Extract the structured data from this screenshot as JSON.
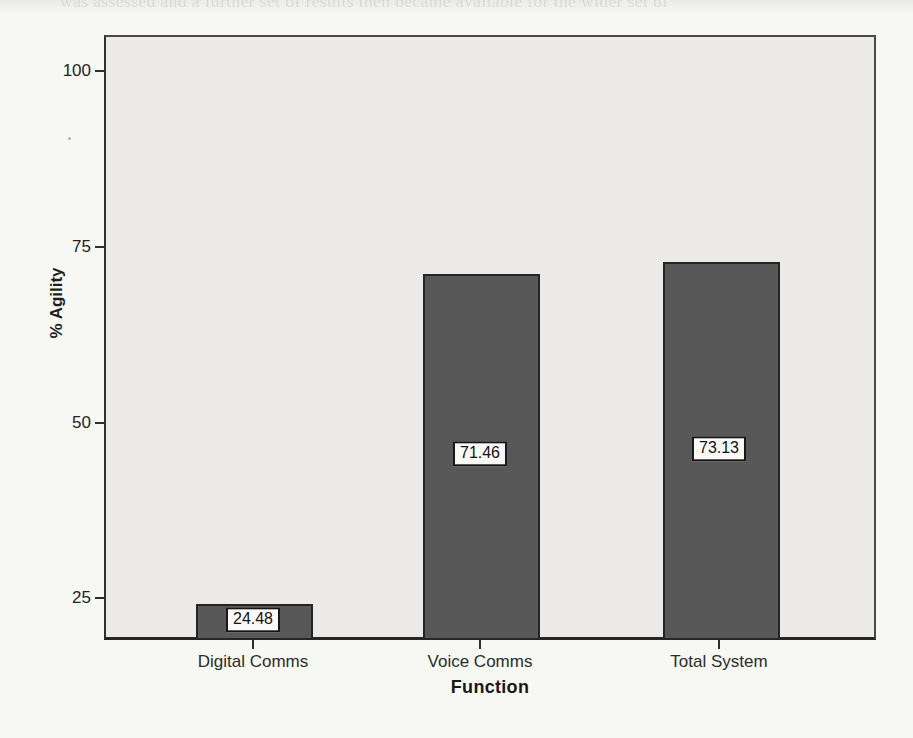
{
  "page": {
    "kind": "scanned book page with statistics figure",
    "background_color": "#f7f7f4"
  },
  "chart_data": {
    "type": "bar",
    "title": "",
    "xlabel": "Function",
    "ylabel": "% Agility",
    "categories": [
      "Digital Comms",
      "Voice Comms",
      "Total System"
    ],
    "values": [
      24.48,
      71.46,
      73.13
    ],
    "value_labels": [
      "24.48",
      "71.46",
      "73.13"
    ],
    "y_ticks": [
      100,
      75,
      50,
      25
    ],
    "ylim": [
      19.5,
      104.9
    ],
    "grid": false,
    "legend": false,
    "bar_color": "#585859",
    "bar_border_color": "#242424",
    "plot_background": "#ebeae7",
    "value_label_style": "white box with black border centered inside each bar"
  },
  "bleedthrough": {
    "note": "faint, mostly illegible show-through text from the reverse side of the page",
    "lines": [
      {
        "x": 60,
        "y": -9,
        "text": "was assessed and a further set of results then became available for the wider set of"
      },
      {
        "x": 185,
        "y": 44,
        "text": "that the overall results are more consistent than they might at first appear"
      },
      {
        "x": 150,
        "y": 74,
        "text": "sistent with Alberts and Hayes' (2003) interpretation of what the"
      },
      {
        "x": 142,
        "y": 104,
        "text": "when mapped to the NATO SAS-050 approach space. In this case the b"
      },
      {
        "x": 138,
        "y": 134,
        "text": "behaved 'voice' messaging within the MIP, different media were"
      },
      {
        "x": 132,
        "y": 163,
        "text": "faster agility, but the more complex and prescribed compass-bas"
      },
      {
        "x": 172,
        "y": 193,
        "text": "such as decentralised faster report"
      },
      {
        "x": 196,
        "y": 228,
        "text": "This chapter has not put forward any specific a priori hypotheses"
      },
      {
        "x": 146,
        "y": 260,
        "text": "been given voice but in the analysis of C2, and even then it seemed"
      },
      {
        "x": 150,
        "y": 290,
        "text": "continue in the next two chapters, continue to pull data out (albeit)"
      },
      {
        "x": 168,
        "y": 318,
        "text": "these analyses remain in the case of moments 'why' c"
      }
    ]
  }
}
